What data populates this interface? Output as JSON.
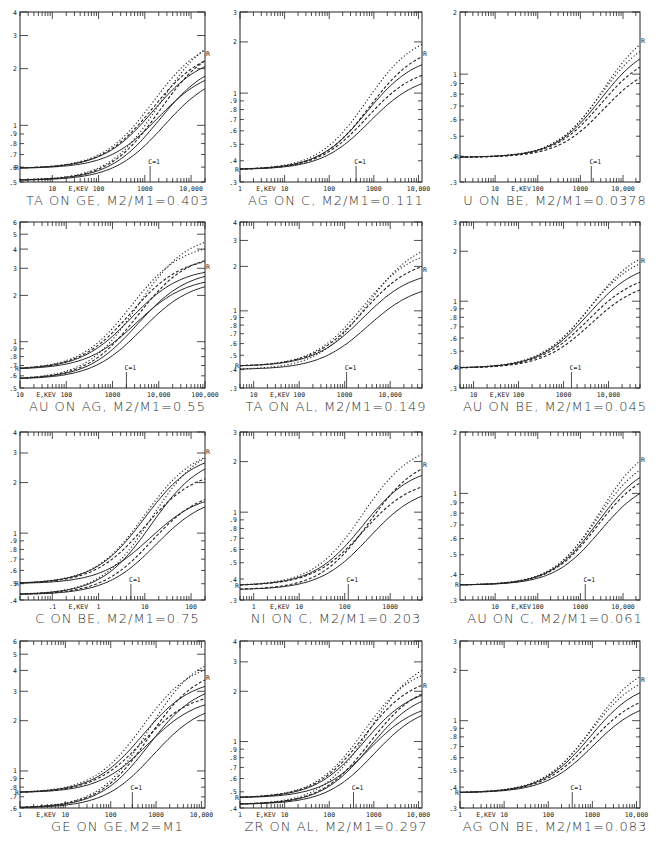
{
  "chart_data": [
    {
      "type": "line",
      "title": "TA ON GE, M2/M1=0.403",
      "xlabel": "E,KEV",
      "xscale": "log",
      "yscale": "log",
      "xlim": [
        2,
        20000
      ],
      "ylim": [
        0.5,
        4
      ],
      "x_ticklabels": [
        "10",
        "100",
        "1000",
        "10,000"
      ],
      "x_ticklabel_values": [
        10,
        100,
        1000,
        10000
      ],
      "y_ticklabels": [
        "4",
        "3",
        "2",
        "1",
        ".9",
        ".8",
        ".7",
        ".6",
        ".5"
      ],
      "y_ticklabel_values": [
        4,
        3,
        2,
        1,
        0.9,
        0.8,
        0.7,
        0.6,
        0.5
      ],
      "annotation": "C=1",
      "annotation_x": 1300,
      "end_marker": "R",
      "groups": [
        {
          "low": 0.59,
          "mid_x": 1500,
          "highs": {
            "solid": [
              2.4,
              2.25,
              2.05,
              1.95
            ],
            "dashed": [
              2.6,
              2.8
            ],
            "dotted": [
              3.0,
              3.3
            ]
          }
        },
        {
          "low": 0.51,
          "mid_x": 1800,
          "highs": {}
        }
      ]
    },
    {
      "type": "line",
      "title": "AG ON C, M2/M1=0.111",
      "xlabel": "E,KEV",
      "xscale": "log",
      "yscale": "log",
      "xlim": [
        1,
        12000
      ],
      "ylim": [
        0.3,
        3
      ],
      "x_ticklabels": [
        "1",
        "10",
        "100",
        "1000",
        "10,000"
      ],
      "x_ticklabel_values": [
        1,
        10,
        100,
        1000,
        10000
      ],
      "y_ticklabels": [
        "3",
        "2",
        "1",
        ".9",
        ".8",
        ".7",
        ".6",
        ".5",
        ".4",
        ".3"
      ],
      "y_ticklabel_values": [
        3,
        2,
        1,
        0.9,
        0.8,
        0.7,
        0.6,
        0.5,
        0.4,
        0.3
      ],
      "annotation": "C=1",
      "annotation_x": 400,
      "end_marker": "R",
      "groups": [
        {
          "low": 0.355,
          "mid_x": 700,
          "highs": {
            "solid": [
              1.7,
              1.3
            ],
            "dashed": [
              1.45,
              1.95
            ],
            "dotted": [
              2.3
            ]
          }
        }
      ]
    },
    {
      "type": "line",
      "title": "U ON BE, M2/M1=0.0378",
      "xlabel": "E,KEV",
      "xscale": "log",
      "yscale": "log",
      "xlim": [
        1.5,
        25000
      ],
      "ylim": [
        0.3,
        2
      ],
      "x_ticklabels": [
        "10",
        "100",
        "1000",
        "10,000"
      ],
      "x_ticklabel_values": [
        10,
        100,
        1000,
        10000
      ],
      "y_ticklabels": [
        "2",
        "1",
        ".9",
        ".8",
        ".7",
        ".6",
        ".5",
        ".4",
        ".3"
      ],
      "y_ticklabel_values": [
        2,
        1,
        0.9,
        0.8,
        0.7,
        0.6,
        0.5,
        0.4,
        0.3
      ],
      "annotation": "C=1",
      "annotation_x": 1800,
      "end_marker": "R",
      "groups": [
        {
          "low": 0.395,
          "mid_x": 3000,
          "highs": {
            "solid": [
              1.45
            ],
            "dashed": [
              1.3,
              1.15
            ],
            "dotted": [
              1.6,
              1.8
            ]
          }
        }
      ]
    },
    {
      "type": "line",
      "title": "AU ON AG, M2/M1=0.55",
      "xlabel": "E,KEV",
      "xscale": "log",
      "yscale": "log",
      "xlim": [
        10,
        100000
      ],
      "ylim": [
        0.5,
        6
      ],
      "x_ticklabels": [
        "10",
        "100",
        "1000",
        "10,000",
        "100,000"
      ],
      "x_ticklabel_values": [
        10,
        100,
        1000,
        10000,
        100000
      ],
      "y_ticklabels": [
        "6",
        "5",
        "4",
        "3",
        "2",
        "1",
        ".9",
        ".8",
        ".7",
        ".6",
        ".5"
      ],
      "y_ticklabel_values": [
        6,
        5,
        4,
        3,
        2,
        1,
        0.9,
        0.8,
        0.7,
        0.6,
        0.5
      ],
      "annotation": "C=1",
      "annotation_x": 2000,
      "end_marker": "R",
      "groups": [
        {
          "low": 0.66,
          "mid_x": 2500,
          "highs": {
            "solid": [
              3.05,
              2.95,
              2.65,
              2.55
            ],
            "dashed": [
              3.6,
              3.8
            ],
            "dotted": [
              4.4,
              5.1
            ]
          }
        },
        {
          "low": 0.57,
          "mid_x": 3000,
          "highs": {}
        }
      ]
    },
    {
      "type": "line",
      "title": "TA ON AL, M2/M1=0.149",
      "xlabel": "E,KEV",
      "xscale": "log",
      "yscale": "log",
      "xlim": [
        5,
        50000
      ],
      "ylim": [
        0.3,
        4
      ],
      "x_ticklabels": [
        "10",
        "100",
        "1000",
        "10,000"
      ],
      "x_ticklabel_values": [
        10,
        100,
        1000,
        10000
      ],
      "y_ticklabels": [
        "4",
        "3",
        "2",
        "1",
        ".9",
        ".8",
        ".7",
        ".6",
        ".5",
        ".4",
        ".3"
      ],
      "y_ticklabel_values": [
        4,
        3,
        2,
        1,
        0.9,
        0.8,
        0.7,
        0.6,
        0.5,
        0.4,
        0.3
      ],
      "annotation": "C=1",
      "annotation_x": 1100,
      "end_marker": "R",
      "groups": [
        {
          "low": 0.42,
          "mid_x": 2500,
          "highs": {
            "solid": [
              1.9,
              1.55
            ],
            "dashed": [
              2.3
            ],
            "dotted": [
              2.7,
              3.1
            ]
          }
        },
        {
          "low": 0.4,
          "mid_x": 2800,
          "highs": {}
        }
      ]
    },
    {
      "type": "line",
      "title": "AU ON BE, M2/M1=0.045",
      "xlabel": "E,KEV",
      "xscale": "log",
      "yscale": "log",
      "xlim": [
        5,
        50000
      ],
      "ylim": [
        0.3,
        3
      ],
      "x_ticklabels": [
        "10",
        "100",
        "1000",
        "10,000"
      ],
      "x_ticklabel_values": [
        10,
        100,
        1000,
        10000
      ],
      "y_ticklabels": [
        "3",
        "2",
        "1",
        ".9",
        ".8",
        ".7",
        ".6",
        ".5",
        ".4",
        ".3"
      ],
      "y_ticklabel_values": [
        3,
        2,
        1,
        0.9,
        0.8,
        0.7,
        0.6,
        0.5,
        0.4,
        0.3
      ],
      "annotation": "C=1",
      "annotation_x": 1500,
      "end_marker": "R",
      "groups": [
        {
          "low": 0.395,
          "mid_x": 3500,
          "highs": {
            "solid": [
              1.75
            ],
            "dashed": [
              1.5,
              1.35
            ],
            "dotted": [
              2.0,
              2.2
            ]
          }
        }
      ]
    },
    {
      "type": "line",
      "title": "C ON BE, M2/M1=0.75",
      "xlabel": "E,KEV",
      "xscale": "log",
      "yscale": "log",
      "xlim": [
        0.02,
        200
      ],
      "ylim": [
        0.4,
        4
      ],
      "x_ticklabels": [
        ".1",
        "1",
        "10",
        "100"
      ],
      "x_ticklabel_values": [
        0.1,
        1,
        10,
        100
      ],
      "y_ticklabels": [
        "4",
        "3",
        "2",
        "1",
        ".9",
        ".8",
        ".7",
        ".6",
        ".5",
        ".4"
      ],
      "y_ticklabel_values": [
        4,
        3,
        2,
        1,
        0.9,
        0.8,
        0.7,
        0.6,
        0.5,
        0.4
      ],
      "annotation": "C=1",
      "annotation_x": 5,
      "end_marker": "R",
      "groups": [
        {
          "low": 0.5,
          "mid_x": 10,
          "highs": {
            "solid": [
              3.05,
              2.95,
              1.75,
              1.7
            ],
            "dashed": [
              2.4,
              1.85
            ],
            "dotted": [
              3.3,
              3.5
            ]
          }
        },
        {
          "low": 0.43,
          "mid_x": 12,
          "highs": {}
        }
      ]
    },
    {
      "type": "line",
      "title": "NI ON C, M2/M1=0.203",
      "xlabel": "E,KEV",
      "xscale": "log",
      "yscale": "log",
      "xlim": [
        0.5,
        5000
      ],
      "ylim": [
        0.3,
        3
      ],
      "x_ticklabels": [
        "1",
        "10",
        "100",
        "1000"
      ],
      "x_ticklabel_values": [
        1,
        10,
        100,
        1000
      ],
      "y_ticklabels": [
        "3",
        "2",
        "1",
        ".9",
        ".8",
        ".7",
        ".6",
        ".5",
        ".4",
        ".3"
      ],
      "y_ticklabel_values": [
        3,
        2,
        1,
        0.9,
        0.8,
        0.7,
        0.6,
        0.5,
        0.4,
        0.3
      ],
      "annotation": "C=1",
      "annotation_x": 120,
      "end_marker": "R",
      "groups": [
        {
          "low": 0.365,
          "mid_x": 250,
          "highs": {
            "solid": [
              1.9,
              1.45
            ],
            "dashed": [
              1.6,
              2.2
            ],
            "dotted": [
              2.6
            ]
          }
        },
        {
          "low": 0.345,
          "mid_x": 300,
          "highs": {}
        }
      ]
    },
    {
      "type": "line",
      "title": "AU ON C, M2/M1=0.061",
      "xlabel": "E,KEV",
      "xscale": "log",
      "yscale": "log",
      "xlim": [
        1.5,
        25000
      ],
      "ylim": [
        0.3,
        2
      ],
      "x_ticklabels": [
        "10",
        "100",
        "1000",
        "10,000"
      ],
      "x_ticklabel_values": [
        10,
        100,
        1000,
        10000
      ],
      "y_ticklabels": [
        "2",
        "1",
        ".9",
        ".8",
        ".7",
        ".6",
        ".5",
        ".4",
        ".3"
      ],
      "y_ticklabel_values": [
        2,
        1,
        0.9,
        0.8,
        0.7,
        0.6,
        0.5,
        0.4,
        0.3
      ],
      "annotation": "C=1",
      "annotation_x": 1300,
      "end_marker": "R",
      "groups": [
        {
          "low": 0.355,
          "mid_x": 2500,
          "highs": {
            "solid": [
              1.45,
              1.2
            ],
            "dashed": [
              1.35
            ],
            "dotted": [
              1.6,
              1.85
            ]
          }
        }
      ]
    },
    {
      "type": "line",
      "title": "GE ON GE,M2=M1",
      "xlabel": "E,KEV",
      "xscale": "log",
      "yscale": "log",
      "xlim": [
        1,
        12000
      ],
      "ylim": [
        0.6,
        6
      ],
      "x_ticklabels": [
        "1",
        "10",
        "100",
        "1000",
        "10,000"
      ],
      "x_ticklabel_values": [
        1,
        10,
        100,
        1000,
        10000
      ],
      "y_ticklabels": [
        "6",
        "5",
        "4",
        "3",
        "2",
        "1",
        ".9",
        ".8",
        ".7",
        ".6"
      ],
      "y_ticklabel_values": [
        6,
        5,
        4,
        3,
        2,
        1,
        0.9,
        0.8,
        0.7,
        0.6
      ],
      "annotation": "C=1",
      "annotation_x": 300,
      "end_marker": "R",
      "groups": [
        {
          "low": 0.74,
          "mid_x": 500,
          "highs": {
            "solid": [
              3.6,
              3.4,
              2.8,
              2.6
            ],
            "dashed": [
              3.0,
              4.2
            ],
            "dotted": [
              4.6,
              5.2
            ]
          }
        },
        {
          "low": 0.6,
          "mid_x": 600,
          "highs": {}
        }
      ]
    },
    {
      "type": "line",
      "title": "ZR ON AL, M2/M1=0.297",
      "xlabel": "E,KEV",
      "xscale": "log",
      "yscale": "log",
      "xlim": [
        1,
        12000
      ],
      "ylim": [
        0.4,
        4
      ],
      "x_ticklabels": [
        "1",
        "10",
        "100",
        "1000",
        "10,000"
      ],
      "x_ticklabel_values": [
        1,
        10,
        100,
        1000,
        10000
      ],
      "y_ticklabels": [
        "4",
        "3",
        "2",
        "1",
        ".9",
        ".8",
        ".7",
        ".6",
        ".5",
        ".4"
      ],
      "y_ticklabel_values": [
        4,
        3,
        2,
        1,
        0.9,
        0.8,
        0.7,
        0.6,
        0.5,
        0.4
      ],
      "annotation": "C=1",
      "annotation_x": 350,
      "end_marker": "R",
      "groups": [
        {
          "low": 0.46,
          "mid_x": 600,
          "highs": {
            "solid": [
              2.15,
              2.05,
              1.75,
              1.7
            ],
            "dashed": [
              2.5,
              2.3
            ],
            "dotted": [
              2.9,
              3.3
            ]
          }
        },
        {
          "low": 0.42,
          "mid_x": 700,
          "highs": {}
        }
      ]
    },
    {
      "type": "line",
      "title": "AG ON BE, M2/M1=0.083",
      "xlabel": "E,KEV",
      "xscale": "log",
      "yscale": "log",
      "xlim": [
        1,
        12000
      ],
      "ylim": [
        0.3,
        3
      ],
      "x_ticklabels": [
        "1",
        "10",
        "100",
        "1000",
        "10,000"
      ],
      "x_ticklabel_values": [
        1,
        10,
        100,
        1000,
        10000
      ],
      "y_ticklabels": [
        "3",
        "2",
        "1",
        ".9",
        ".8",
        ".7",
        ".6",
        ".5",
        ".4",
        ".3"
      ],
      "y_ticklabel_values": [
        3,
        2,
        1,
        0.9,
        0.8,
        0.7,
        0.6,
        0.5,
        0.4,
        0.3
      ],
      "annotation": "C=1",
      "annotation_x": 350,
      "end_marker": "R",
      "groups": [
        {
          "low": 0.37,
          "mid_x": 900,
          "highs": {
            "solid": [
              1.75,
              1.35
            ],
            "dashed": [
              1.5
            ],
            "dotted": [
              2.0,
              2.3
            ]
          }
        }
      ]
    }
  ],
  "layout": {
    "columns": [
      {
        "x": 20,
        "w": 185
      },
      {
        "x": 240,
        "w": 182
      },
      {
        "x": 460,
        "w": 180
      }
    ],
    "rows": [
      {
        "y": 12,
        "h": 170
      },
      {
        "y": 222,
        "h": 166
      },
      {
        "y": 432,
        "h": 168
      },
      {
        "y": 641,
        "h": 167
      }
    ],
    "ink_color": "#222222"
  }
}
